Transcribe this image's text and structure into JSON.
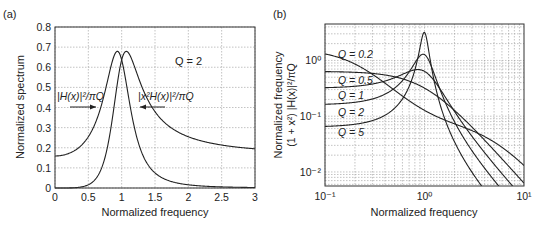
{
  "chart_data": [
    {
      "panel": "(a)",
      "type": "line",
      "title": "",
      "xlabel": "Normalized frequency",
      "ylabel": "Normalized spectrum",
      "xlim": [
        0,
        3
      ],
      "ylim": [
        0,
        0.8
      ],
      "xticks": [
        "0",
        "0.5",
        "1",
        "1.5",
        "2",
        "2.5",
        "3"
      ],
      "yticks": [
        "0",
        "0.1",
        "0.2",
        "0.3",
        "0.4",
        "0.5",
        "0.6",
        "0.7",
        "0.8"
      ],
      "grid": true,
      "annotations": [
        {
          "text": "Q = 2",
          "x": 1.8,
          "y": 0.66
        },
        {
          "text": "|H(x)|²/πQ",
          "x": 0.05,
          "y": 0.47,
          "arrow_to": [
            0.65,
            0.4
          ]
        },
        {
          "text": "|x²H(x)|²/πQ",
          "x": 1.25,
          "y": 0.47,
          "arrow_to": [
            1.25,
            0.4
          ]
        }
      ],
      "Q": 2,
      "series": [
        {
          "name": "|H(x)|²/πQ",
          "x": [
            0,
            0.25,
            0.5,
            0.6,
            0.7,
            0.8,
            0.9,
            0.93,
            1.0,
            1.1,
            1.2,
            1.3,
            1.5,
            2.0,
            2.5,
            3.0
          ],
          "values": [
            0.159,
            0.17,
            0.21,
            0.26,
            0.33,
            0.48,
            0.66,
            0.68,
            0.64,
            0.45,
            0.29,
            0.19,
            0.1,
            0.04,
            0.017,
            0.009
          ]
        },
        {
          "name": "|x²H(x)|²/πQ",
          "x": [
            0,
            0.25,
            0.5,
            0.6,
            0.7,
            0.8,
            0.9,
            0.98,
            1.0,
            1.1,
            1.2,
            1.3,
            1.5,
            2.0,
            2.5,
            3.0
          ],
          "values": [
            0,
            0.001,
            0.013,
            0.033,
            0.08,
            0.2,
            0.45,
            0.64,
            0.64,
            0.55,
            0.42,
            0.32,
            0.22,
            0.1,
            0.06,
            0.03
          ]
        }
      ]
    },
    {
      "panel": "(b)",
      "type": "line",
      "title": "",
      "xlabel": "Normalized frequency",
      "ylabel": "Normalized frequency",
      "ylabel2": "(1 + x²) |H(x)|²/πQ",
      "xscale": "log",
      "yscale": "log",
      "xlim": [
        0.1,
        10
      ],
      "ylim": [
        0.0056,
        4.5
      ],
      "xticks": [
        "10⁻¹",
        "10⁰",
        "10¹"
      ],
      "yticks": [
        "10⁻²",
        "10⁻¹",
        "10⁰"
      ],
      "grid": true,
      "series": [
        {
          "name": "Q = 0.2",
          "Q": 0.2,
          "x": [
            0.1,
            0.3,
            1,
            3,
            10
          ],
          "values": [
            1.47,
            0.75,
            0.32,
            0.09,
            0.012
          ]
        },
        {
          "name": "Q = 0.5",
          "Q": 0.5,
          "x": [
            0.1,
            0.3,
            1,
            3,
            10
          ],
          "values": [
            0.64,
            0.66,
            0.64,
            0.12,
            0.0065
          ]
        },
        {
          "name": "Q = 1",
          "Q": 1,
          "x": [
            0.1,
            0.3,
            1,
            3,
            10
          ],
          "values": [
            0.32,
            0.37,
            0.64,
            0.05,
            0.0033
          ]
        },
        {
          "name": "Q = 2",
          "Q": 2,
          "x": [
            0.1,
            0.3,
            1,
            3,
            10
          ],
          "values": [
            0.16,
            0.2,
            1.27,
            0.027,
            0.0017
          ]
        },
        {
          "name": "Q = 5",
          "Q": 5,
          "x": [
            0.1,
            0.3,
            1,
            3,
            10
          ],
          "values": [
            0.064,
            0.084,
            3.18,
            0.011,
            0.0007
          ]
        }
      ]
    }
  ],
  "panels": {
    "a": {
      "label": "(a)",
      "xlabel": "Normalized frequency",
      "ylabel": "Normalized spectrum",
      "q_annotation": "Q = 2",
      "ann_h": "|H(x)|²/πQ",
      "ann_x2h": "|x²H(x)|²/πQ"
    },
    "b": {
      "label": "(b)",
      "xlabel": "Normalized frequency",
      "ylabel1": "Normalized frequency",
      "ylabel2": "(1 + x²) |H(x)|²/πQ",
      "q_labels": [
        "Q = 0.2",
        "Q = 0.5",
        "Q = 1",
        "Q = 2",
        "Q = 5"
      ]
    }
  }
}
